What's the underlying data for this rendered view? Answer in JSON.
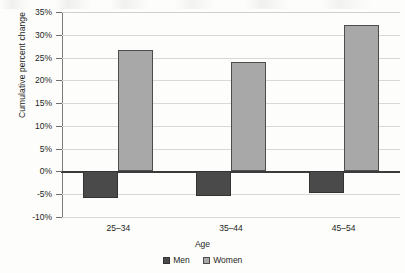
{
  "chart_data": {
    "type": "bar",
    "title": "",
    "xlabel": "Age",
    "ylabel": "Cumulative percent change",
    "categories": [
      "25–34",
      "35–44",
      "45–54"
    ],
    "series": [
      {
        "name": "Men",
        "values": [
          -5.8,
          -5.5,
          -4.7
        ],
        "color": "#4a4a4a"
      },
      {
        "name": "Women",
        "values": [
          26.7,
          24.1,
          32.1
        ],
        "color": "#a8a8a8"
      }
    ],
    "ylim": [
      -10,
      35
    ],
    "ytick_labels": [
      "35%",
      "30%",
      "25%",
      "20%",
      "15%",
      "10%",
      "5%",
      "0%",
      "-5%",
      "-10%"
    ],
    "ytick_values": [
      35,
      30,
      25,
      20,
      15,
      10,
      5,
      0,
      -5,
      -10
    ],
    "grid": true,
    "legend_position": "bottom",
    "zero_line": 0
  }
}
